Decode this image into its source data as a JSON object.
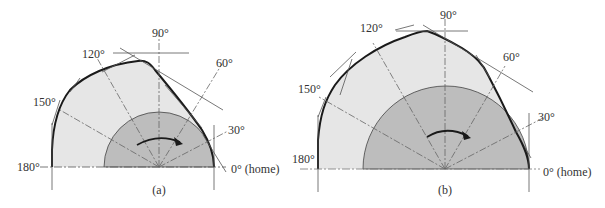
{
  "figure": {
    "colors": {
      "outer_fill": "#e6e6e6",
      "inner_fill": "#bdbdbd",
      "profile_stroke": "#1a1a1a",
      "construction_stroke": "#555555"
    },
    "panels": [
      {
        "id": "a",
        "caption": "(a)",
        "labels": {
          "deg90": "90°",
          "deg120": "120°",
          "deg60": "60°",
          "deg150": "150°",
          "deg30": "30°",
          "deg180": "180°",
          "deg0": "0° (home)"
        }
      },
      {
        "id": "b",
        "caption": "(b)",
        "labels": {
          "deg90": "90°",
          "deg120": "120°",
          "deg60": "60°",
          "deg150": "150°",
          "deg30": "30°",
          "deg180": "180°",
          "deg0": "0° (home)"
        }
      }
    ],
    "rotation_arrow": "clockwise"
  }
}
